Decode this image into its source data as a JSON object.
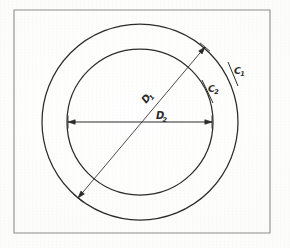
{
  "document": {
    "kind": "hand-drawn-engineering-sketch",
    "subject": "annulus-two-concentric-circles",
    "background_color": "#fdfdfc",
    "ink_color": "#2b2b2b"
  },
  "frame": {
    "name": "drawing-border",
    "x": 14,
    "y": 10,
    "width": 256,
    "height": 223,
    "stroke_color": "#8d8d8a",
    "stroke_width": 1.1
  },
  "geometry": {
    "center": {
      "x": 140,
      "y": 122
    },
    "outer_circle": {
      "label": "C1",
      "radius": 98,
      "stroke_color": "#2b2b2b",
      "stroke_width": 1.25
    },
    "inner_circle": {
      "label": "C2",
      "radius": 73,
      "stroke_color": "#2b2b2b",
      "stroke_width": 1.25
    }
  },
  "dimensions": [
    {
      "name": "outer-diameter-dimension",
      "label": "D",
      "subscript": "1",
      "applies_to": "C1",
      "style": "double-arrow",
      "orientation": "diagonal",
      "x1": 78,
      "y1": 198,
      "x2": 205,
      "y2": 47,
      "label_x": 146,
      "label_y": 104,
      "label_rotation": -50
    },
    {
      "name": "inner-diameter-dimension",
      "label": "D",
      "subscript": "2",
      "applies_to": "C2",
      "style": "double-arrow",
      "orientation": "horizontal",
      "x1": 68,
      "y1": 122,
      "x2": 212,
      "y2": 122,
      "label_x": 156,
      "label_y": 119,
      "label_rotation": 0
    }
  ],
  "callouts": [
    {
      "name": "outer-circle-callout",
      "label": "C",
      "subscript": "1",
      "label_x": 234,
      "label_y": 74,
      "leader_x1": 228,
      "leader_y1": 62,
      "leader_x2": 238,
      "leader_y2": 86
    },
    {
      "name": "inner-circle-callout",
      "label": "C",
      "subscript": "2",
      "label_x": 208,
      "label_y": 92,
      "leader_x1": 202,
      "leader_y1": 80,
      "leader_x2": 213,
      "leader_y2": 103
    }
  ]
}
